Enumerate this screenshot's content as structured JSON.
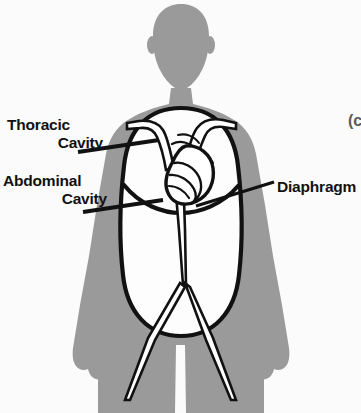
{
  "figure": {
    "kind": "anatomy-diagram",
    "view": "anterior",
    "colors": {
      "background": "#fbfbfb",
      "body_silhouette": "#9a9a9a",
      "cavity_fill": "#fdfdfd",
      "outline": "#111111",
      "label_text": "#111111",
      "vessel_fill": "#ffffff"
    }
  },
  "labels": {
    "thoracic": {
      "line1": "Thoracic",
      "line2": "Cavity"
    },
    "abdominal": {
      "line1": "Abdominal",
      "line2": "Cavity"
    },
    "diaphragm": "Diaphragm"
  },
  "marks": {
    "copyright_fragment": "(c"
  },
  "regions": [
    {
      "name": "thoracic-cavity",
      "label": "Thoracic Cavity",
      "contains": "heart-and-great-vessels"
    },
    {
      "name": "abdominal-cavity",
      "label": "Abdominal Cavity",
      "contains": "descending-aorta"
    },
    {
      "name": "diaphragm",
      "label": "Diaphragm",
      "role": "divider-between-cavities"
    }
  ]
}
